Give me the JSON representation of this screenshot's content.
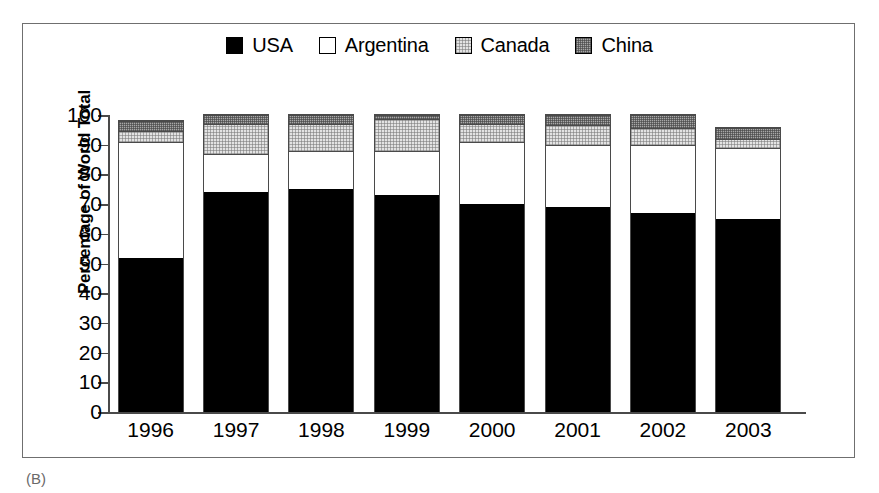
{
  "figure": {
    "panel_caption": "(B)"
  },
  "legend": {
    "position": "top-center",
    "entries": [
      {
        "label": "USA",
        "swatch": "solid-black-swatch",
        "color": "#000000"
      },
      {
        "label": "Argentina",
        "swatch": "white-swatch",
        "color": "#ffffff"
      },
      {
        "label": "Canada",
        "swatch": "light-gray-dot-swatch",
        "color": "#e3e3e3"
      },
      {
        "label": "China",
        "swatch": "dark-gray-dot-swatch",
        "color": "#a8a8a8"
      }
    ]
  },
  "axes": {
    "ylabel": "Percentage of World Total",
    "xlabel": "",
    "yticks": [
      100,
      90,
      80,
      70,
      60,
      50,
      40,
      30,
      20,
      10,
      0
    ],
    "ylim": [
      0,
      100
    ]
  },
  "chart_data": {
    "type": "bar",
    "stacked": true,
    "title": "",
    "xlabel": "",
    "ylabel": "Percentage of World Total",
    "ylim": [
      0,
      100
    ],
    "grid": false,
    "legend_position": "top-center",
    "categories": [
      "1996",
      "1997",
      "1998",
      "1999",
      "2000",
      "2001",
      "2002",
      "2003"
    ],
    "series": [
      {
        "name": "USA",
        "color": "#000000",
        "values": [
          52,
          74,
          75,
          73,
          70,
          69,
          67,
          65
        ]
      },
      {
        "name": "Argentina",
        "color": "#ffffff",
        "values": [
          39,
          13,
          13,
          15,
          21,
          21,
          23,
          24
        ]
      },
      {
        "name": "Canada",
        "color": "#e3e3e3",
        "values": [
          3.5,
          10,
          9,
          10.5,
          6,
          6.5,
          5.5,
          3
        ]
      },
      {
        "name": "China",
        "color": "#a8a8a8",
        "values": [
          3.5,
          3,
          3,
          1.5,
          3,
          3.5,
          4.5,
          3.5
        ]
      }
    ],
    "totals": [
      98,
      100,
      100,
      100,
      100,
      100,
      100,
      95.5
    ]
  }
}
